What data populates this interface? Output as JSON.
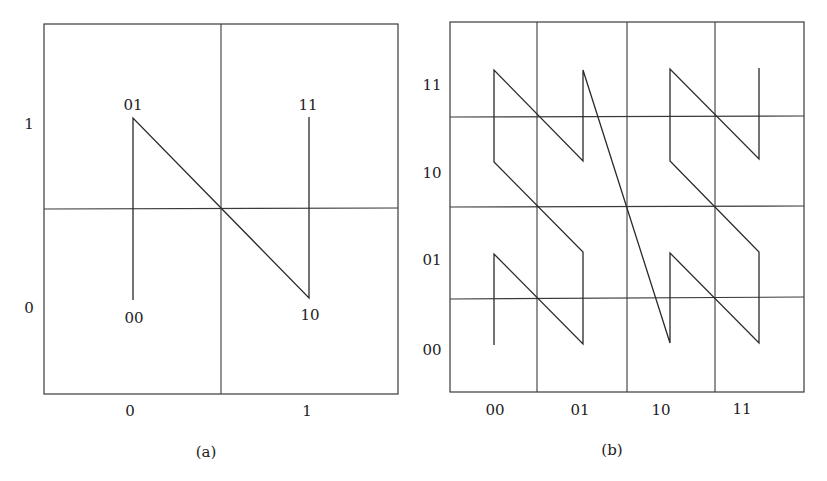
{
  "figure": {
    "panels": [
      {
        "id": "a",
        "caption": "(a)",
        "x_ticks": [
          "0",
          "1"
        ],
        "y_ticks": [
          "1",
          "0"
        ],
        "point_labels": [
          "00",
          "01",
          "10",
          "11"
        ],
        "curve_order": [
          "00",
          "01",
          "10",
          "11"
        ]
      },
      {
        "id": "b",
        "caption": "(b)",
        "x_ticks": [
          "00",
          "01",
          "10",
          "11"
        ],
        "y_ticks": [
          "11",
          "10",
          "01",
          "00"
        ]
      }
    ]
  },
  "colors": {
    "line": "#2a2a2a",
    "grid": "#3a3a3a",
    "background": "#ffffff"
  }
}
